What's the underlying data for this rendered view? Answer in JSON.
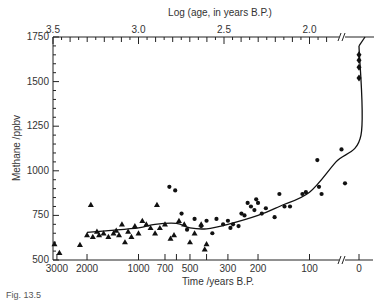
{
  "chart_data": {
    "type": "scatter",
    "title": "",
    "xlabel": "Time /years B.P.",
    "x2label": "Log (age, in years B.P.)",
    "ylabel": "Methane /ppbv",
    "ylim": [
      500,
      1750
    ],
    "yticks": [
      500,
      750,
      1000,
      1250,
      1500,
      1750
    ],
    "xticks_bottom": [
      "3000",
      "2000",
      "1000",
      "700",
      "500",
      "300",
      "200",
      "100",
      "0"
    ],
    "xticks_top": [
      "3.5",
      "3.0",
      "2.5",
      "2.0"
    ],
    "x_scale": "log (years B.P.) with axis break before 0",
    "grid": false,
    "legend": null,
    "series": [
      {
        "name": "Triangles (older ice core samples)",
        "marker": "triangle",
        "points": [
          {
            "age": 3100,
            "ch4": 590
          },
          {
            "age": 2900,
            "ch4": 540
          },
          {
            "age": 2200,
            "ch4": 585
          },
          {
            "age": 2000,
            "ch4": 640
          },
          {
            "age": 1900,
            "ch4": 810
          },
          {
            "age": 1850,
            "ch4": 630
          },
          {
            "age": 1750,
            "ch4": 660
          },
          {
            "age": 1700,
            "ch4": 640
          },
          {
            "age": 1600,
            "ch4": 650
          },
          {
            "age": 1500,
            "ch4": 630
          },
          {
            "age": 1400,
            "ch4": 650
          },
          {
            "age": 1350,
            "ch4": 665
          },
          {
            "age": 1300,
            "ch4": 640
          },
          {
            "age": 1250,
            "ch4": 700
          },
          {
            "age": 1200,
            "ch4": 600
          },
          {
            "age": 1150,
            "ch4": 660
          },
          {
            "age": 1100,
            "ch4": 630
          },
          {
            "age": 1050,
            "ch4": 690
          },
          {
            "age": 1000,
            "ch4": 650
          },
          {
            "age": 950,
            "ch4": 720
          },
          {
            "age": 900,
            "ch4": 700
          },
          {
            "age": 850,
            "ch4": 680
          },
          {
            "age": 800,
            "ch4": 650
          },
          {
            "age": 780,
            "ch4": 810
          },
          {
            "age": 750,
            "ch4": 680
          },
          {
            "age": 700,
            "ch4": 700
          },
          {
            "age": 650,
            "ch4": 620
          },
          {
            "age": 620,
            "ch4": 640
          },
          {
            "age": 580,
            "ch4": 720
          },
          {
            "age": 540,
            "ch4": 700
          },
          {
            "age": 500,
            "ch4": 600
          },
          {
            "age": 470,
            "ch4": 650
          },
          {
            "age": 430,
            "ch4": 700
          },
          {
            "age": 410,
            "ch4": 560
          },
          {
            "age": 400,
            "ch4": 590
          }
        ]
      },
      {
        "name": "Circles (recent ice core / firn samples)",
        "marker": "circle",
        "points": [
          {
            "age": 660,
            "ch4": 910
          },
          {
            "age": 610,
            "ch4": 890
          },
          {
            "age": 560,
            "ch4": 760
          },
          {
            "age": 520,
            "ch4": 670
          },
          {
            "age": 470,
            "ch4": 730
          },
          {
            "age": 430,
            "ch4": 690
          },
          {
            "age": 400,
            "ch4": 720
          },
          {
            "age": 370,
            "ch4": 650
          },
          {
            "age": 350,
            "ch4": 730
          },
          {
            "age": 320,
            "ch4": 700
          },
          {
            "age": 300,
            "ch4": 720
          },
          {
            "age": 290,
            "ch4": 680
          },
          {
            "age": 280,
            "ch4": 700
          },
          {
            "age": 260,
            "ch4": 690
          },
          {
            "age": 250,
            "ch4": 760
          },
          {
            "age": 240,
            "ch4": 750
          },
          {
            "age": 230,
            "ch4": 820
          },
          {
            "age": 220,
            "ch4": 800
          },
          {
            "age": 210,
            "ch4": 780
          },
          {
            "age": 205,
            "ch4": 840
          },
          {
            "age": 200,
            "ch4": 820
          },
          {
            "age": 190,
            "ch4": 760
          },
          {
            "age": 180,
            "ch4": 790
          },
          {
            "age": 160,
            "ch4": 740
          },
          {
            "age": 150,
            "ch4": 870
          },
          {
            "age": 140,
            "ch4": 800
          },
          {
            "age": 130,
            "ch4": 800
          },
          {
            "age": 110,
            "ch4": 870
          },
          {
            "age": 105,
            "ch4": 880
          },
          {
            "age": 90,
            "ch4": 1060
          },
          {
            "age": 88,
            "ch4": 910
          },
          {
            "age": 85,
            "ch4": 870
          },
          {
            "age": 65,
            "ch4": 1120
          },
          {
            "age": 62,
            "ch4": 930
          }
        ]
      },
      {
        "name": "Diamonds (modern atmospheric measurements)",
        "marker": "diamond",
        "points": [
          {
            "age": 0,
            "ch4": 1650
          },
          {
            "age": 0,
            "ch4": 1620
          },
          {
            "age": 0,
            "ch4": 1580
          },
          {
            "age": 0,
            "ch4": 1520
          }
        ]
      },
      {
        "name": "Smoothed fit",
        "marker": "line",
        "points": [
          {
            "age": 2000,
            "ch4": 655
          },
          {
            "age": 1500,
            "ch4": 665
          },
          {
            "age": 1000,
            "ch4": 680
          },
          {
            "age": 800,
            "ch4": 700
          },
          {
            "age": 600,
            "ch4": 705
          },
          {
            "age": 500,
            "ch4": 680
          },
          {
            "age": 400,
            "ch4": 675
          },
          {
            "age": 300,
            "ch4": 700
          },
          {
            "age": 200,
            "ch4": 750
          },
          {
            "age": 150,
            "ch4": 800
          },
          {
            "age": 100,
            "ch4": 880
          },
          {
            "age": 70,
            "ch4": 1050
          },
          {
            "age": 50,
            "ch4": 1200
          },
          {
            "age": 0,
            "ch4": 1700
          }
        ]
      }
    ]
  },
  "labels": {
    "top_axis_title": "Log (age, in years B.P.)",
    "bottom_axis_title": "Time /years B.P.",
    "y_axis_title": "Methane /ppbv",
    "caption": "Fig. 13.5"
  }
}
